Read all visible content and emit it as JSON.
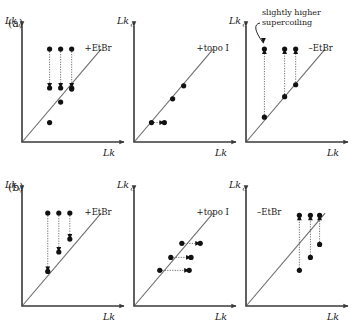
{
  "figure": {
    "axis": {
      "y_label_main": "Lk",
      "y_label_sub": "o",
      "x_label": "Lk"
    },
    "colors": {
      "axis": "#3a3a3a",
      "diagonal": "#6b6b6b",
      "dot": "#111111",
      "connector": "#555555",
      "background": "#ffffff"
    },
    "rows": [
      {
        "letter": "(a)",
        "name": "row-a-relaxed-dna",
        "panels": [
          {
            "name": "panel-a1",
            "treatment": "+EtBr",
            "treatment_position": "right",
            "annotation": null,
            "series": [
              {
                "x": 0.3,
                "y_start": 0.86,
                "y_end": 0.5,
                "arrow": "down",
                "start_dot": true,
                "end_dot": true
              },
              {
                "x": 0.42,
                "y_start": 0.86,
                "y_end": 0.5,
                "arrow": "down",
                "start_dot": true,
                "end_dot": true
              },
              {
                "x": 0.54,
                "y_start": 0.86,
                "y_end": 0.5,
                "arrow": "down",
                "start_dot": true,
                "end_dot": true
              }
            ],
            "extra_dots": [
              {
                "x": 0.3,
                "y": 0.18
              },
              {
                "x": 0.42,
                "y": 0.37
              },
              {
                "x": 0.54,
                "y": 0.49
              }
            ]
          },
          {
            "name": "panel-a2",
            "treatment": "+topo I",
            "treatment_position": "right",
            "annotation": null,
            "series": [
              {
                "x_start": 0.19,
                "x_end": 0.33,
                "y": 0.18,
                "arrow": "right",
                "start_dot": true,
                "end_dot": true
              }
            ],
            "extra_dots": [
              {
                "x": 0.42,
                "y": 0.4
              },
              {
                "x": 0.54,
                "y": 0.52
              }
            ]
          },
          {
            "name": "panel-a3",
            "treatment": "–EtBr",
            "treatment_position": "right",
            "annotation": {
              "line1": "slightly higher",
              "line2": "supercoiling",
              "has_curved_arrow": true
            },
            "series": [
              {
                "x": 0.2,
                "y_start": 0.23,
                "y_end": 0.86,
                "arrow": "up",
                "start_dot": true,
                "end_dot": true
              },
              {
                "x": 0.42,
                "y_start": 0.42,
                "y_end": 0.86,
                "arrow": "up",
                "start_dot": true,
                "end_dot": true
              },
              {
                "x": 0.54,
                "y_start": 0.53,
                "y_end": 0.86,
                "arrow": "up",
                "start_dot": true,
                "end_dot": true
              }
            ],
            "extra_dots": []
          }
        ]
      },
      {
        "letter": "(b)",
        "name": "row-b-supercoiled-dna",
        "panels": [
          {
            "name": "panel-b1",
            "treatment": "+EtBr",
            "treatment_position": "right",
            "annotation": null,
            "series": [
              {
                "x": 0.28,
                "y_start": 0.86,
                "y_end": 0.32,
                "arrow": "down",
                "start_dot": true,
                "end_dot": true
              },
              {
                "x": 0.4,
                "y_start": 0.86,
                "y_end": 0.5,
                "arrow": "down",
                "start_dot": true,
                "end_dot": true
              },
              {
                "x": 0.52,
                "y_start": 0.86,
                "y_end": 0.62,
                "arrow": "down",
                "start_dot": true,
                "end_dot": true
              }
            ],
            "extra_dots": []
          },
          {
            "name": "panel-b2",
            "treatment": "+topo I",
            "treatment_position": "right",
            "annotation": null,
            "series": [
              {
                "x_start": 0.28,
                "x_end": 0.6,
                "y": 0.33,
                "arrow": "right",
                "start_dot": true,
                "end_dot": true
              },
              {
                "x_start": 0.4,
                "x_end": 0.62,
                "y": 0.45,
                "arrow": "right",
                "start_dot": true,
                "end_dot": true
              },
              {
                "x_start": 0.52,
                "x_end": 0.72,
                "y": 0.58,
                "arrow": "right",
                "start_dot": true,
                "end_dot": true
              }
            ],
            "extra_dots": []
          },
          {
            "name": "panel-b3",
            "treatment": "–EtBr",
            "treatment_position": "left",
            "annotation": null,
            "series": [
              {
                "x": 0.58,
                "y_start": 0.33,
                "y_end": 0.84,
                "arrow": "up",
                "start_dot": true,
                "end_dot": true
              },
              {
                "x": 0.7,
                "y_start": 0.45,
                "y_end": 0.84,
                "arrow": "up",
                "start_dot": true,
                "end_dot": true
              },
              {
                "x": 0.8,
                "y_start": 0.57,
                "y_end": 0.84,
                "arrow": "up",
                "start_dot": true,
                "end_dot": true
              }
            ],
            "extra_dots": []
          }
        ]
      }
    ]
  }
}
